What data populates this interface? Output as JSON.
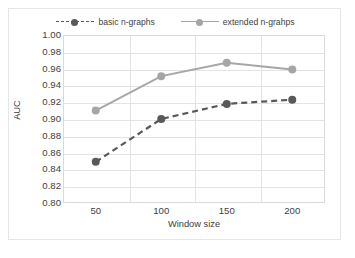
{
  "chart_data": {
    "type": "line",
    "title": "",
    "xlabel": "Window size",
    "ylabel": "AUC",
    "categories": [
      50,
      100,
      150,
      200
    ],
    "xtick_labels": [
      "50",
      "100",
      "150",
      "200"
    ],
    "ytick_labels": [
      "1.00",
      "0.98",
      "0.96",
      "0.94",
      "0.92",
      "0.90",
      "0.88",
      "0.86",
      "0.84",
      "0.82",
      "0.80"
    ],
    "ylim": [
      0.8,
      1.0
    ],
    "ytick_step": 0.02,
    "grid": "horizontal",
    "legend_position": "top",
    "series": [
      {
        "name": "basic n-graphs",
        "values": [
          0.849,
          0.9,
          0.918,
          0.923
        ],
        "color": "#595959",
        "line_style": "dashed",
        "marker": "circle"
      },
      {
        "name": "extended n-grahps",
        "values": [
          0.91,
          0.951,
          0.967,
          0.959
        ],
        "color": "#a6a6a6",
        "line_style": "solid",
        "marker": "circle"
      }
    ]
  },
  "legend": {
    "entries": [
      {
        "label": "basic n-graphs"
      },
      {
        "label": "extended n-grahps"
      }
    ]
  },
  "axes": {
    "y_title": "AUC",
    "x_title": "Window size"
  },
  "colors": {
    "series_basic": "#595959",
    "series_extended": "#a6a6a6",
    "gridline": "#e3e3e3",
    "plot_border": "#d9d9d9",
    "text": "#404040",
    "background": "#ffffff"
  }
}
